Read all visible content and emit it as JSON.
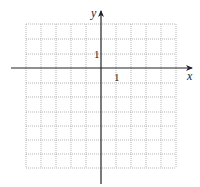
{
  "diagram": {
    "type": "coordinate-grid",
    "axes": {
      "x_label": "x",
      "y_label": "y",
      "x_tick_label": "1",
      "y_tick_label": "1"
    },
    "grid": {
      "columns_left_of_y_axis": 5,
      "columns_right_of_y_axis": 5,
      "rows_above_x_axis": 3,
      "rows_below_x_axis": 7,
      "unit": 1,
      "line_style": "dotted"
    },
    "colors": {
      "grid": "#9a9a9a",
      "axes": "#222222",
      "background": "#ffffff"
    }
  }
}
